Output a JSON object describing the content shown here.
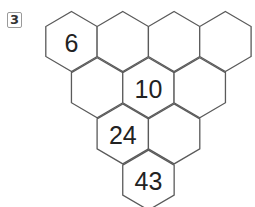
{
  "problem": {
    "number": "3"
  },
  "puzzle": {
    "type": "hexagon-pyramid",
    "rows": [
      [
        "6",
        "",
        "",
        ""
      ],
      [
        "",
        "10",
        ""
      ],
      [
        "24",
        ""
      ],
      [
        "43"
      ]
    ],
    "stroke_color": "#5a5a5a",
    "text_color": "#222222"
  }
}
